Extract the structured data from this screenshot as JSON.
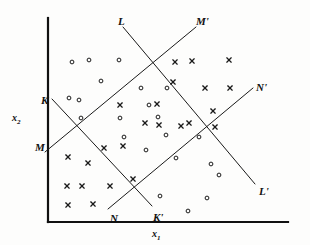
{
  "figure": {
    "kind": "scatter-plot-with-decision-boundaries",
    "background": "#fdfdfc",
    "ink_color": "#1a1a1a",
    "axis_color": "#111111"
  },
  "axes": {
    "x_label": "x",
    "x_label_sub": "1",
    "y_label": "x",
    "y_label_sub": "2",
    "x_axis": {
      "x1": 48,
      "y1": 222,
      "x2": 288,
      "y2": 222
    },
    "y_axis": {
      "x1": 48,
      "y1": 222,
      "x2": 48,
      "y2": 18
    }
  },
  "line_labels": [
    {
      "name": "L",
      "text": "L",
      "x": 118,
      "y": 16
    },
    {
      "name": "Mp",
      "text": "M'",
      "x": 196,
      "y": 16
    },
    {
      "name": "K",
      "text": "K",
      "x": 41,
      "y": 95
    },
    {
      "name": "Np",
      "text": "N'",
      "x": 256,
      "y": 82
    },
    {
      "name": "M",
      "text": "M",
      "x": 35,
      "y": 142
    },
    {
      "name": "Lp",
      "text": "L'",
      "x": 259,
      "y": 186
    },
    {
      "name": "N",
      "text": "N",
      "x": 110,
      "y": 213
    },
    {
      "name": "Kp",
      "text": "K'",
      "x": 153,
      "y": 212
    }
  ],
  "chart_data": {
    "type": "scatter",
    "title": "",
    "xlabel": "x1",
    "ylabel": "x2",
    "grid": false,
    "legend": "none",
    "xlim": [
      48,
      288
    ],
    "ylim": [
      18,
      222
    ],
    "note": "Pixel coordinates in image space; y increases downward.",
    "boundary_lines": [
      {
        "name": "K-K'",
        "from_label": "K",
        "to_label": "K'",
        "x1": 52,
        "y1": 99,
        "x2": 152,
        "y2": 206
      },
      {
        "name": "L-L'",
        "from_label": "L",
        "to_label": "L'",
        "x1": 123,
        "y1": 27,
        "x2": 255,
        "y2": 184
      },
      {
        "name": "M-M'",
        "from_label": "M",
        "to_label": "M'",
        "x1": 45,
        "y1": 152,
        "x2": 196,
        "y2": 27
      },
      {
        "name": "N-N'",
        "from_label": "N",
        "to_label": "N'",
        "x1": 108,
        "y1": 209,
        "x2": 253,
        "y2": 88
      }
    ],
    "series": [
      {
        "name": "class-circle",
        "marker": "o",
        "points": [
          [
            72,
            62
          ],
          [
            89,
            60
          ],
          [
            119,
            60
          ],
          [
            101,
            81
          ],
          [
            69,
            98
          ],
          [
            79,
            100
          ],
          [
            81,
            118
          ],
          [
            120,
            118
          ],
          [
            149,
            105
          ],
          [
            124,
            137
          ],
          [
            146,
            150
          ],
          [
            158,
            117
          ],
          [
            166,
            135
          ],
          [
            167,
            88
          ],
          [
            199,
            137
          ],
          [
            176,
            158
          ],
          [
            211,
            164
          ],
          [
            219,
            175
          ],
          [
            160,
            196
          ],
          [
            207,
            198
          ],
          [
            188,
            211
          ],
          [
            141,
            88
          ]
        ]
      },
      {
        "name": "class-cross",
        "marker": "x",
        "points": [
          [
            192,
            61
          ],
          [
            229,
            60
          ],
          [
            175,
            62
          ],
          [
            173,
            82
          ],
          [
            205,
            88
          ],
          [
            230,
            88
          ],
          [
            120,
            105
          ],
          [
            213,
            111
          ],
          [
            157,
            104
          ],
          [
            189,
            123
          ],
          [
            145,
            123
          ],
          [
            181,
            126
          ],
          [
            68,
            157
          ],
          [
            88,
            163
          ],
          [
            215,
            127
          ],
          [
            67,
            186
          ],
          [
            82,
            186
          ],
          [
            110,
            186
          ],
          [
            133,
            179
          ],
          [
            93,
            204
          ],
          [
            68,
            205
          ],
          [
            159,
            125
          ],
          [
            123,
            146
          ],
          [
            104,
            148
          ]
        ]
      }
    ]
  }
}
